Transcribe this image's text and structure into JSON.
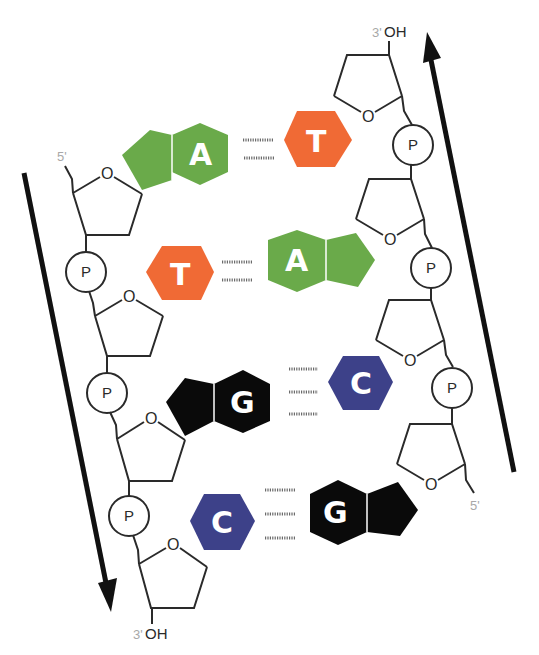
{
  "diagram": {
    "colors": {
      "adenine": "#6aaa4a",
      "thymine": "#f06a35",
      "guanine": "#0a0a0a",
      "cytosine": "#3d4189",
      "backbone": "#2a2a2a",
      "arrow": "#111111",
      "end_label": "#a8a8a8"
    },
    "left_strand": {
      "top_label": "5'",
      "bottom_label_prime": "3'",
      "bottom_label_oh": "OH",
      "direction": "down",
      "sugar_oxygen": "O",
      "phosphate": "P"
    },
    "right_strand": {
      "top_label_prime": "3'",
      "top_label_oh": "OH",
      "bottom_label": "5'",
      "direction": "up",
      "sugar_oxygen": "O",
      "phosphate": "P"
    },
    "base_pairs": [
      {
        "left": "A",
        "right": "T",
        "hydrogen_bonds": 2
      },
      {
        "left": "T",
        "right": "A",
        "hydrogen_bonds": 2
      },
      {
        "left": "G",
        "right": "C",
        "hydrogen_bonds": 3
      },
      {
        "left": "C",
        "right": "G",
        "hydrogen_bonds": 3
      }
    ]
  }
}
